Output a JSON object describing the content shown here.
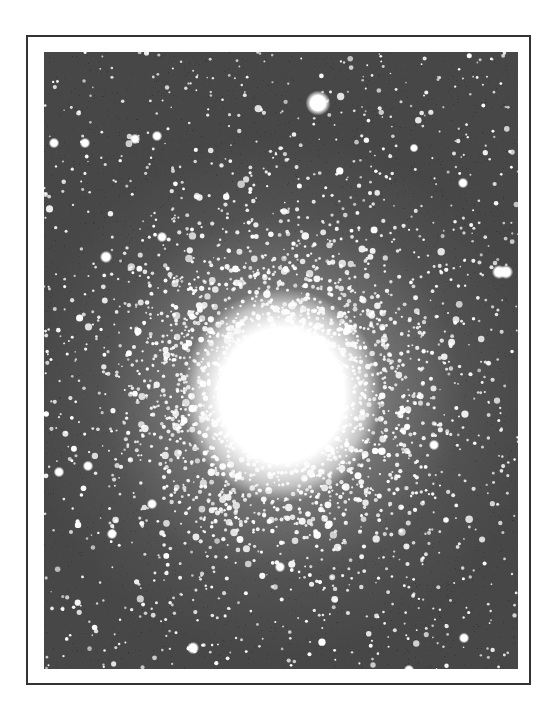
{
  "figure": {
    "style": "black-and-white halftone photograph",
    "alt": "Globular star cluster photograph with a dense bright core"
  },
  "colors": {
    "page_background": "#ffffff",
    "frame_border": "#333333",
    "sky": "#474747",
    "star": "#ffffff"
  },
  "cluster": {
    "core_center": [
      238,
      343
    ],
    "core_radius_x": 80,
    "core_radius_y": 86,
    "halo_radius": 260
  },
  "bright_stars": [
    {
      "x": 274,
      "y": 51,
      "r": 7
    },
    {
      "x": 455,
      "y": 220,
      "r": 4
    },
    {
      "x": 462,
      "y": 220,
      "r": 4
    },
    {
      "x": 113,
      "y": 84,
      "r": 3
    },
    {
      "x": 91,
      "y": 87,
      "r": 3
    },
    {
      "x": 41,
      "y": 91,
      "r": 3
    },
    {
      "x": 62,
      "y": 205,
      "r": 3.5
    },
    {
      "x": 10,
      "y": 91,
      "r": 3
    },
    {
      "x": 44,
      "y": 414,
      "r": 3
    },
    {
      "x": 108,
      "y": 452,
      "r": 3
    },
    {
      "x": 68,
      "y": 482,
      "r": 3
    },
    {
      "x": 149,
      "y": 596,
      "r": 3.5
    },
    {
      "x": 279,
      "y": 623,
      "r": 3
    },
    {
      "x": 236,
      "y": 515,
      "r": 3
    },
    {
      "x": 390,
      "y": 393,
      "r": 3
    },
    {
      "x": 118,
      "y": 185,
      "r": 3
    },
    {
      "x": 419,
      "y": 131,
      "r": 3
    },
    {
      "x": 370,
      "y": 96,
      "r": 2.5
    },
    {
      "x": 15,
      "y": 420,
      "r": 3
    },
    {
      "x": 365,
      "y": 618,
      "r": 3
    },
    {
      "x": 420,
      "y": 586,
      "r": 3
    }
  ],
  "field": {
    "seed": 1729,
    "background_star_count": 900,
    "cluster_star_count": 2600
  }
}
